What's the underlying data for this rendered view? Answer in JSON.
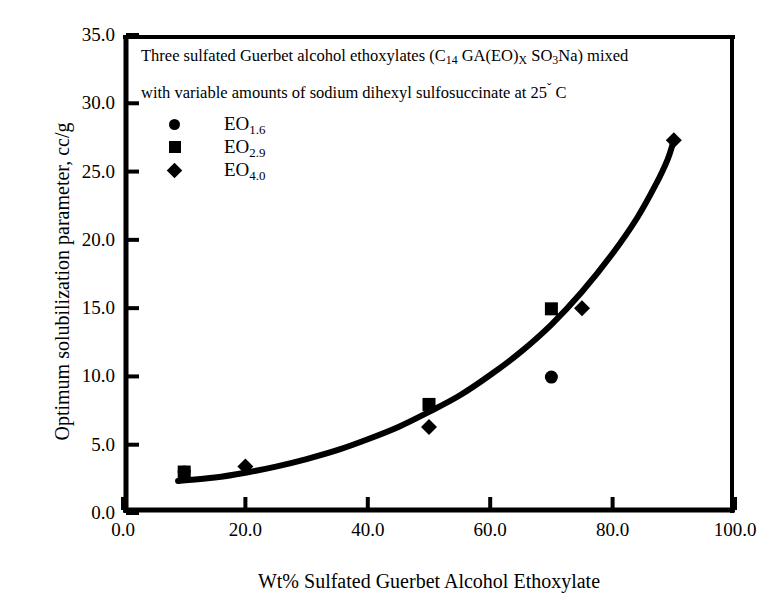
{
  "chart_data": {
    "type": "scatter",
    "title": "",
    "caption_lines": [
      "Three sulfated Guerbet alcohol ethoxylates (C14 GA(EO)X SO3Na) mixed",
      "with variable amounts of sodium dihexyl sulfosuccinate at 25˘ C"
    ],
    "caption_line1_parts": {
      "a": "Three sulfated Guerbet alcohol ethoxylates (C",
      "sub1": "14",
      "b": " GA(EO)",
      "sub2": "X",
      "c": " SO",
      "sub3": "3",
      "d": "Na) mixed"
    },
    "caption_line2_parts": {
      "a": "with variable amounts of sodium dihexyl sulfosuccinate at 25",
      "deg": "ˇ",
      "b": " C"
    },
    "xlabel": "Wt% Sulfated Guerbet Alcohol Ethoxylate",
    "ylabel": "Optimum solubilization parameter, cc/g",
    "xlim": [
      0.0,
      100.0
    ],
    "ylim": [
      0.0,
      35.0
    ],
    "xticks": [
      "0.0",
      "20.0",
      "40.0",
      "60.0",
      "80.0",
      "100.0"
    ],
    "xtick_values": [
      0,
      20,
      40,
      60,
      80,
      100
    ],
    "yticks": [
      "0.0",
      "5.0",
      "10.0",
      "15.0",
      "20.0",
      "25.0",
      "30.0",
      "35.0"
    ],
    "ytick_values": [
      0,
      5,
      10,
      15,
      20,
      25,
      30,
      35
    ],
    "grid": false,
    "legend_position": "upper-left-inside",
    "series": [
      {
        "name": "EO 1.6",
        "label_base": "EO",
        "label_sub": "1.6",
        "marker": "circle",
        "color": "#000000",
        "points": [
          [
            10,
            3.0
          ],
          [
            70,
            9.95
          ]
        ]
      },
      {
        "name": "EO 2.9",
        "label_base": "EO",
        "label_sub": "2.9",
        "marker": "square",
        "color": "#000000",
        "points": [
          [
            10,
            3.0
          ],
          [
            50,
            7.95
          ],
          [
            70,
            14.95
          ]
        ]
      },
      {
        "name": "EO 4.0",
        "label_base": "EO",
        "label_sub": "4.0",
        "marker": "diamond",
        "color": "#000000",
        "points": [
          [
            20,
            3.4
          ],
          [
            50,
            6.3
          ],
          [
            75,
            15.0
          ],
          [
            90,
            27.3
          ]
        ]
      }
    ],
    "trend_curve": {
      "name": "fitted trend",
      "color": "#000000",
      "width": 6,
      "points": [
        [
          9,
          2.35
        ],
        [
          15,
          2.6
        ],
        [
          20,
          2.95
        ],
        [
          25,
          3.4
        ],
        [
          30,
          3.95
        ],
        [
          35,
          4.6
        ],
        [
          40,
          5.4
        ],
        [
          45,
          6.3
        ],
        [
          50,
          7.4
        ],
        [
          55,
          8.6
        ],
        [
          60,
          10.1
        ],
        [
          65,
          11.8
        ],
        [
          70,
          13.8
        ],
        [
          75,
          16.2
        ],
        [
          80,
          19.0
        ],
        [
          84,
          21.6
        ],
        [
          87,
          24.0
        ],
        [
          89,
          25.9
        ],
        [
          90,
          27.3
        ]
      ]
    }
  },
  "axes_pixels": {
    "left": 123,
    "right": 735,
    "top": 35,
    "bottom": 513
  }
}
